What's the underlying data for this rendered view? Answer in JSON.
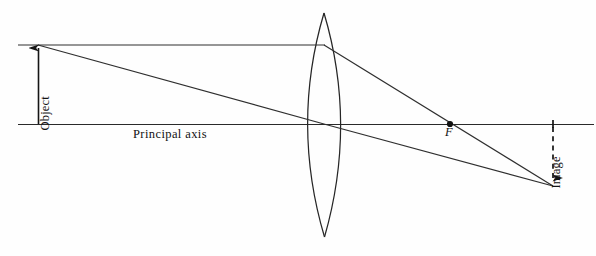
{
  "figure": {
    "background_color": "#fefefe",
    "stroke_color": "#1a1a1a",
    "width": 596,
    "height": 256
  },
  "labels": {
    "object": "Object",
    "image": "Image",
    "principal_axis": "Principal axis",
    "focal_point": "F"
  },
  "geometry": {
    "principal_axis": {
      "x1": 18,
      "y1": 124,
      "x2": 594,
      "y2": 124
    },
    "object_arrow": {
      "x": 38,
      "y_base": 124,
      "y_tip": 45
    },
    "image_arrow": {
      "x": 553,
      "y_base": 127,
      "y_tip": 185,
      "dashed": true
    },
    "lens": {
      "center_x": 324,
      "top_y": 13,
      "bottom_y": 237,
      "half_width": 33,
      "type": "biconvex"
    },
    "focal_point": {
      "x": 450,
      "y": 124,
      "dot_radius": 3.1
    },
    "parallel_ray": {
      "incoming": {
        "x1": 18,
        "y1": 45,
        "x2": 324,
        "y2": 45
      },
      "refracted": {
        "x1": 324,
        "y1": 45,
        "x2": 553,
        "y2": 185
      }
    },
    "center_ray": {
      "incoming": {
        "x1": 38,
        "y1": 45,
        "x2": 324,
        "y2": 124
      },
      "refracted": {
        "x1": 324,
        "y1": 124,
        "x2": 553,
        "y2": 185
      }
    }
  }
}
